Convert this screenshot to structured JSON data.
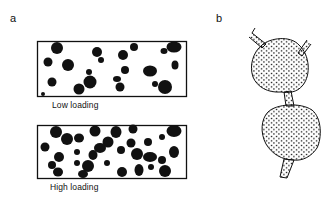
{
  "panels": {
    "a": {
      "label": "a",
      "boxes": [
        {
          "caption": "Low loading"
        },
        {
          "caption": "High loading"
        }
      ]
    },
    "b": {
      "label": "b"
    }
  },
  "colors": {
    "ink": "#111111",
    "background": "#ffffff"
  }
}
